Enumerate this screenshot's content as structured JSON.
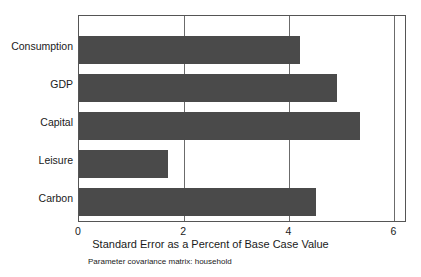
{
  "chart_data": {
    "type": "bar",
    "orientation": "horizontal",
    "title": "",
    "subtitle": "Parameter covariance matrix: household",
    "xlabel": "Standard Error as a Percent of Base Case Value",
    "ylabel": "",
    "categories": [
      "Consumption",
      "GDP",
      "Capital",
      "Leisure",
      "Carbon"
    ],
    "values": [
      4.2,
      4.9,
      5.35,
      1.7,
      4.5
    ],
    "xlim": [
      0,
      6.2
    ],
    "xticks": [
      0,
      2,
      4,
      6
    ],
    "xtick_labels": [
      "0",
      "2",
      "4",
      "6"
    ],
    "grid": "vertical",
    "legend": "none",
    "bar_color": "#4a4a4a",
    "axis_color": "#555555"
  }
}
